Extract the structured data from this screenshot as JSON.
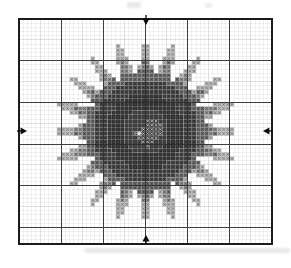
{
  "grid": {
    "left": 19,
    "top": 19,
    "right": 272,
    "bottom": 244,
    "cols": 60,
    "rows": 54,
    "bold_every": 10,
    "mid_every": 5,
    "bg": "#ffffff",
    "thin_line": "#cccccc",
    "mid_line": "#a8a8a8",
    "thick_line": "#2f2f2f",
    "border_line": "#1c1c1c"
  },
  "flower": {
    "center_col": 30,
    "center_row": 27,
    "core_inner_radius": 5.5,
    "core_radius": 9.3,
    "ring_radius": 12.4,
    "petal_count": 20,
    "petal_min": 14,
    "petal_max": 22,
    "petal_phase": 0.0,
    "petal_sharpness": 1.4
  },
  "palette": {
    "core_inner_bg": "#3a3a3a",
    "core_bg": "#2c2c2c",
    "core_glyph": "#4b4b4b",
    "ring_bg": "#474747",
    "ring_glyph": "#242424",
    "petal_base_bg": "#6c6c6c",
    "petal_base_glyph": "#383838",
    "petal_mid_bg": "#919191",
    "petal_mid_glyph": "#454545",
    "petal_dark_bg": "#757575",
    "petal_dark_glyph": "#3a3a3a",
    "petal_light_bg": "#b7b7b7",
    "petal_light_glyph": "#6b6b6b",
    "highlight_bg": "#383838",
    "highlight_glyph": "#f5f5f5",
    "star": "#ffffff"
  },
  "center_highlights": {
    "cells": [
      [
        0,
        -3
      ],
      [
        1,
        -3
      ],
      [
        2,
        -3
      ],
      [
        0,
        -2
      ],
      [
        1,
        -2
      ],
      [
        2,
        -2
      ],
      [
        3,
        -2
      ],
      [
        -1,
        -1
      ],
      [
        0,
        -1
      ],
      [
        1,
        -1
      ],
      [
        2,
        -1
      ],
      [
        3,
        -1
      ],
      [
        -3,
        0
      ],
      [
        -1,
        0
      ],
      [
        0,
        0
      ],
      [
        1,
        0
      ],
      [
        2,
        0
      ],
      [
        3,
        0
      ],
      [
        -2,
        1
      ],
      [
        -1,
        1
      ],
      [
        0,
        1
      ],
      [
        1,
        1
      ],
      [
        2,
        1
      ],
      [
        -1,
        2
      ],
      [
        0,
        2
      ],
      [
        1,
        2
      ],
      [
        0,
        3
      ]
    ],
    "star_cell": [
      -2,
      0
    ]
  },
  "markers": {
    "color": "#0b0b0b",
    "top": {
      "x": 146,
      "y": 21
    },
    "bottom": {
      "x": 146,
      "y": 239
    },
    "left": {
      "x": 23,
      "y": 131
    },
    "right": {
      "x": 267,
      "y": 131
    }
  },
  "artifacts": [
    {
      "x": 127,
      "y": 2,
      "w": 14,
      "h": 6
    },
    {
      "x": 205,
      "y": 3,
      "w": 7,
      "h": 5
    },
    {
      "x": 84,
      "y": 248,
      "w": 206,
      "h": 5
    }
  ]
}
